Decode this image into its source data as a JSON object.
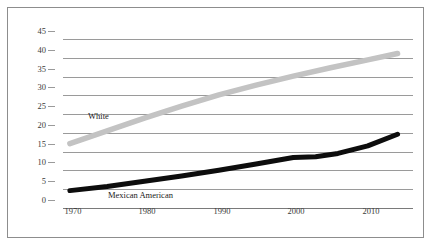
{
  "chart_data": {
    "type": "line",
    "title": "",
    "subtitle": "",
    "xlabel": "",
    "ylabel": "",
    "xlim": [
      1968,
      2015
    ],
    "ylim": [
      0,
      45
    ],
    "grid": "horizontal",
    "legend_position": "inline-annotations",
    "xticks": [
      "1970",
      "1980",
      "1990",
      "2000",
      "2010"
    ],
    "xtick_values": [
      1970,
      1980,
      1990,
      2000,
      2010
    ],
    "yticks": [
      "0",
      "5",
      "10",
      "15",
      "20",
      "25",
      "30",
      "35",
      "40",
      "45"
    ],
    "ytick_values": [
      0,
      5,
      10,
      15,
      20,
      25,
      30,
      35,
      40,
      45
    ],
    "series": [
      {
        "name": "White",
        "color": "#c3c3c3",
        "label_text": "White",
        "x": [
          1970,
          1975,
          1980,
          1985,
          1990,
          1995,
          2000,
          2005,
          2010,
          2014
        ],
        "values": [
          15.0,
          18.4,
          21.8,
          25.0,
          28.0,
          30.6,
          33.0,
          35.2,
          37.3,
          39.0
        ]
      },
      {
        "name": "Mexican American",
        "color": "#0d0d0d",
        "label_text": "Mexican American",
        "x": [
          1970,
          1975,
          1980,
          1985,
          1990,
          1995,
          2000,
          2003,
          2006,
          2010,
          2014
        ],
        "values": [
          2.5,
          3.6,
          5.0,
          6.4,
          7.9,
          9.6,
          11.3,
          11.5,
          12.4,
          14.4,
          17.5
        ]
      }
    ]
  }
}
